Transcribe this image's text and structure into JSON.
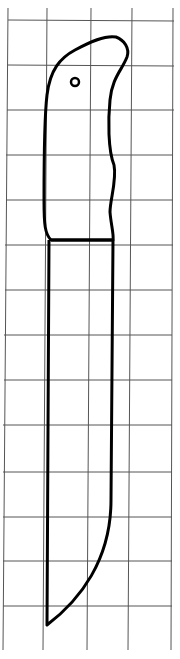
{
  "figure": {
    "grid_color": "#555555",
    "outline_color": "#000000",
    "background": "#ffffff"
  }
}
